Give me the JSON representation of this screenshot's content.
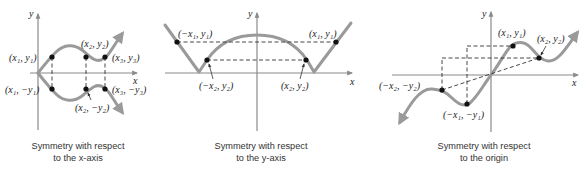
{
  "panels": [
    {
      "id": "x-axis-symmetry",
      "caption_line1": "Symmetry with respect",
      "caption_line2": "to the x-axis",
      "axis_labels": {
        "x": "x",
        "y": "y"
      },
      "points": [
        {
          "label": "(x1, y1)",
          "display": "(x₁, y₁)"
        },
        {
          "label": "(x2, y2)",
          "display": "(x₂, y₂)"
        },
        {
          "label": "(x3, y3)",
          "display": "(x₃, y₃)"
        },
        {
          "label": "(x1, -y1)",
          "display": "(x₁, −y₁)"
        },
        {
          "label": "(x2, -y2)",
          "display": "(x₂, −y₂)"
        },
        {
          "label": "(x3, -y3)",
          "display": "(x₃, −y₃)"
        }
      ]
    },
    {
      "id": "y-axis-symmetry",
      "caption_line1": "Symmetry with respect",
      "caption_line2": "to the y-axis",
      "axis_labels": {
        "x": "x",
        "y": "y"
      },
      "points": [
        {
          "label": "(-x1, y1)",
          "display": "(−x₁, y₁)"
        },
        {
          "label": "(x1, y1)",
          "display": "(x₁, y₁)"
        },
        {
          "label": "(-x2, y2)",
          "display": "(−x₂, y₂)"
        },
        {
          "label": "(x2, y2)",
          "display": "(x₂, y₂)"
        }
      ]
    },
    {
      "id": "origin-symmetry",
      "caption_line1": "Symmetry with respect",
      "caption_line2": "to the origin",
      "axis_labels": {
        "x": "x",
        "y": "y"
      },
      "points": [
        {
          "label": "(x1, y1)",
          "display": "(x₁, y₁)"
        },
        {
          "label": "(x2, y2)",
          "display": "(x₂, y₂)"
        },
        {
          "label": "(-x2, -y2)",
          "display": "(−x₂, −y₂)"
        },
        {
          "label": "(-x1, -y1)",
          "display": "(−x₁, −y₁)"
        }
      ]
    }
  ],
  "colors": {
    "curve": "#9a9a9a",
    "axis": "#8a8a8a",
    "point": "#111111",
    "text": "#222222"
  }
}
